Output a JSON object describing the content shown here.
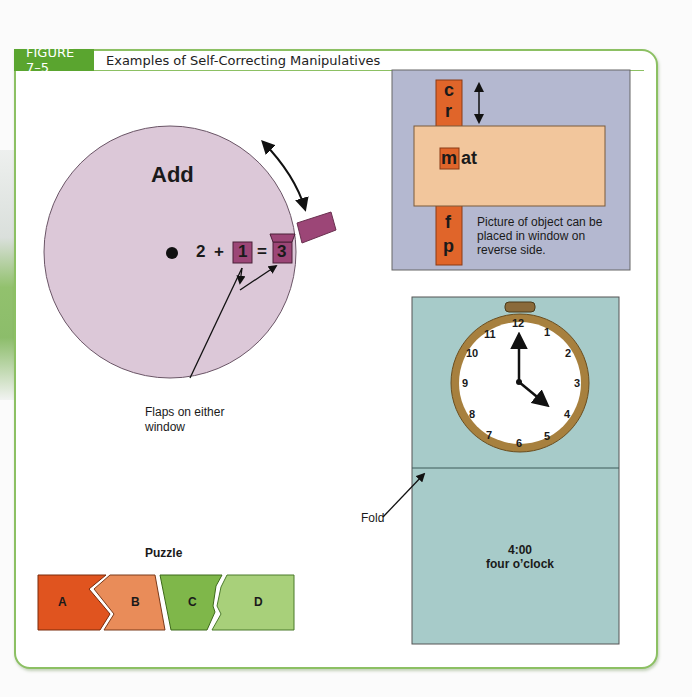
{
  "figure": {
    "number": "FIGURE 7–5",
    "title": "Examples of Self-Correcting Manipulatives",
    "accent_color": "#5aa52f",
    "border_color": "#8cc063"
  },
  "add_wheel": {
    "title": "Add",
    "equation": {
      "a": "2",
      "plus": "+",
      "b": "1",
      "equals": "=",
      "result": "3"
    },
    "caption_line1": "Flaps on either",
    "caption_line2": "window",
    "wheel_color": "#dcc8d8",
    "flap_color": "#9c4677"
  },
  "word_slider": {
    "top_letters": [
      "c",
      "r"
    ],
    "bottom_letters": [
      "f",
      "p"
    ],
    "window_letter": "m",
    "word_ending": "at",
    "note_line1": "Picture of object can be",
    "note_line2": "placed in window on",
    "note_line3": "reverse side.",
    "background_color": "#b4b8d0",
    "strip_color": "#e0652a",
    "card_color": "#f2c69c"
  },
  "clock_card": {
    "numbers": [
      "12",
      "1",
      "2",
      "3",
      "4",
      "5",
      "6",
      "7",
      "8",
      "9",
      "10",
      "11"
    ],
    "fold_label": "Fold",
    "time": "4:00",
    "time_words": "four o’clock",
    "card_color": "#a7cbc9",
    "rim_color": "#a7803e"
  },
  "puzzle": {
    "title": "Puzzle",
    "pieces": [
      {
        "label": "A",
        "color": "#e0541f"
      },
      {
        "label": "B",
        "color": "#e98c59"
      },
      {
        "label": "C",
        "color": "#7fb74a"
      },
      {
        "label": "D",
        "color": "#a8d07a"
      }
    ]
  }
}
